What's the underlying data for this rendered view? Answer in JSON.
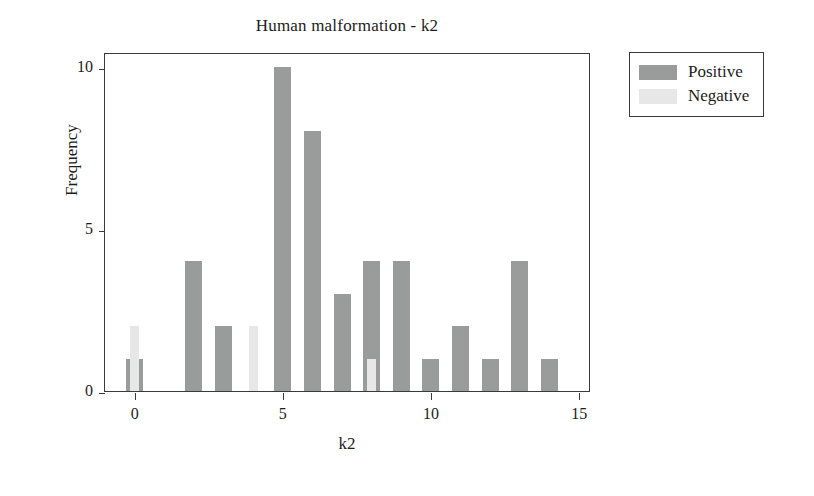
{
  "chart_data": {
    "type": "bar",
    "title": "Human malformation - k2",
    "xlabel": "k2",
    "ylabel": "Frequency",
    "xlim": [
      -1,
      15.4
    ],
    "ylim": [
      0,
      10.45
    ],
    "xticks": [
      "0",
      "5",
      "10",
      "15"
    ],
    "xtick_values": [
      0,
      5,
      10,
      15
    ],
    "yticks": [
      "0",
      "5",
      "10"
    ],
    "ytick_values": [
      0,
      5,
      10
    ],
    "grid": false,
    "legend_position": "upper right outside",
    "categories": [
      0,
      1,
      2,
      3,
      4,
      5,
      6,
      7,
      8,
      9,
      10,
      11,
      12,
      13,
      14
    ],
    "series": [
      {
        "name": "Positive",
        "color": "#9a9b9b",
        "values": [
          1,
          0,
          4,
          2,
          0,
          10,
          8,
          3,
          4,
          4,
          1,
          2,
          1,
          4,
          1
        ]
      },
      {
        "name": "Negative",
        "color": "#e7e7e7",
        "values": [
          2,
          0,
          0,
          0,
          2,
          0,
          0,
          0,
          1,
          0,
          0,
          0,
          0,
          0,
          0
        ]
      }
    ]
  },
  "legend": {
    "entries": [
      {
        "label": "Positive",
        "swatch": "positive"
      },
      {
        "label": "Negative",
        "swatch": "negative"
      }
    ]
  }
}
